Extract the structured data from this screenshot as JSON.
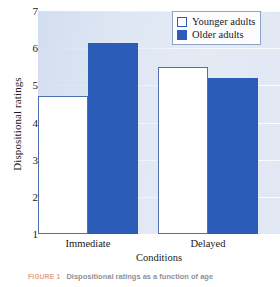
{
  "chart_data": {
    "type": "bar",
    "title": "",
    "xlabel": "Conditions",
    "ylabel": "Dispositional ratings",
    "categories": [
      "Immediate",
      "Delayed"
    ],
    "series": [
      {
        "name": "Younger adults",
        "values": [
          4.7,
          5.5
        ],
        "color": "#ffffff"
      },
      {
        "name": "Older adults",
        "values": [
          6.15,
          5.2
        ],
        "color": "#2a5cb8"
      }
    ],
    "ylim": [
      1,
      7
    ],
    "yticks": [
      1,
      2,
      3,
      4,
      5,
      6,
      7
    ],
    "ytick_labels": [
      "1",
      "2",
      "3",
      "4",
      "5",
      "6",
      "7"
    ],
    "grid": true,
    "legend_position": "top-right"
  },
  "axes": {
    "y_title": "Dispositional ratings",
    "x_title": "Conditions",
    "y_tick_labels": [
      "7",
      "6",
      "5",
      "4",
      "3",
      "2",
      "1"
    ],
    "x_tick_labels": [
      "Immediate",
      "Delayed"
    ]
  },
  "legend": {
    "entries": [
      {
        "label": "Younger adults",
        "swatch": "white-square-swatch"
      },
      {
        "label": "Older adults",
        "swatch": "blue-square-swatch"
      }
    ]
  },
  "caption": {
    "figure_label": "FIGURE 1",
    "text": "Dispositional ratings as a function of age"
  },
  "colors": {
    "bar_older": "#2a5cb8",
    "bar_younger": "#ffffff",
    "bar_border": "#4f6fae",
    "plot_background": "#dde4f1",
    "gridline": "#ffffff",
    "caption_accent": "#c8502a"
  }
}
